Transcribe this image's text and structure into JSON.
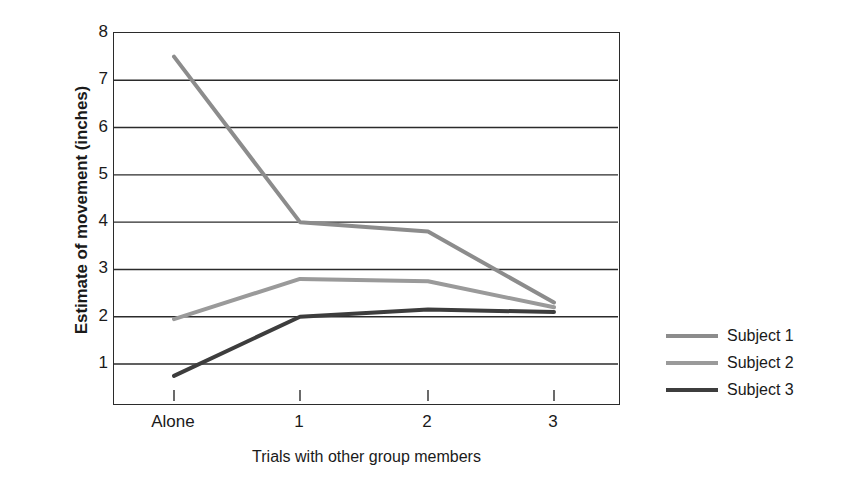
{
  "chart_data": {
    "type": "line",
    "title": "",
    "xlabel": "Trials with other group members",
    "ylabel": "Estimate of movement (inches)",
    "categories": [
      "Alone",
      "1",
      "2",
      "3"
    ],
    "ylim": [
      0,
      8
    ],
    "yticks": [
      1,
      2,
      3,
      4,
      5,
      6,
      7,
      8
    ],
    "grid": "horizontal",
    "legend_position": "right",
    "series": [
      {
        "name": "Subject 1",
        "color": "#8c8c8c",
        "values": [
          7.5,
          4.0,
          3.8,
          2.3
        ]
      },
      {
        "name": "Subject 2",
        "color": "#9a9a9a",
        "values": [
          1.95,
          2.8,
          2.75,
          2.2
        ]
      },
      {
        "name": "Subject 3",
        "color": "#3d3d3d",
        "values": [
          0.75,
          2.0,
          2.15,
          2.1
        ]
      }
    ]
  },
  "axes": {
    "y_title": "Estimate of movement (inches)",
    "x_title": "Trials with other group members",
    "y_tick_labels": [
      "8",
      "7",
      "6",
      "5",
      "4",
      "3",
      "2",
      "1"
    ],
    "x_tick_labels": [
      "Alone",
      "1",
      "2",
      "3"
    ]
  },
  "legend": {
    "items": [
      {
        "label": "Subject 1",
        "color": "#8c8c8c"
      },
      {
        "label": "Subject 2",
        "color": "#9a9a9a"
      },
      {
        "label": "Subject 3",
        "color": "#3d3d3d"
      }
    ]
  },
  "colors": {
    "axis": "#2b2b2b",
    "gridline": "#2b2b2b",
    "text": "#1a1a1a",
    "background": "#ffffff"
  }
}
